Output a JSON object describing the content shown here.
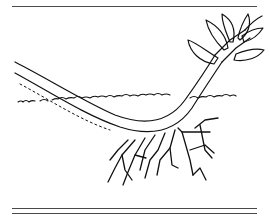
{
  "figure": {
    "colors": {
      "ink": "#111111",
      "rule": "#4a4a4a",
      "background": "#ffffff"
    }
  }
}
